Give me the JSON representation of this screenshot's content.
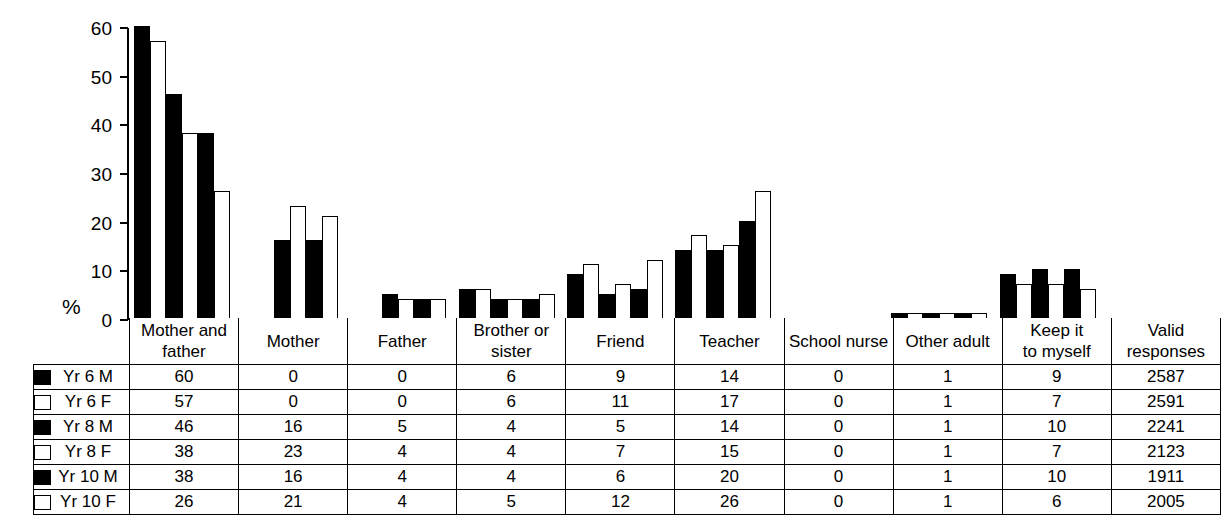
{
  "chart_data": {
    "type": "bar",
    "title": "",
    "xlabel": "",
    "ylabel": "%",
    "ylim": [
      0,
      60
    ],
    "yticks": [
      0,
      10,
      20,
      30,
      40,
      50,
      60
    ],
    "grid": false,
    "legend_position": "table-left",
    "categories": [
      "Mother and father",
      "Mother",
      "Father",
      "Brother or sister",
      "Friend",
      "Teacher",
      "School nurse",
      "Other adult",
      "Keep it to myself"
    ],
    "series": [
      {
        "name": "Yr 6 M",
        "style": "solid",
        "values": [
          60,
          0,
          0,
          6,
          9,
          14,
          0,
          1,
          9
        ]
      },
      {
        "name": "Yr 6 F",
        "style": "hollow",
        "values": [
          57,
          0,
          0,
          6,
          11,
          17,
          0,
          1,
          7
        ]
      },
      {
        "name": "Yr 8 M",
        "style": "solid",
        "values": [
          46,
          16,
          5,
          4,
          5,
          14,
          0,
          1,
          10
        ]
      },
      {
        "name": "Yr 8 F",
        "style": "hollow",
        "values": [
          38,
          23,
          4,
          4,
          7,
          15,
          0,
          1,
          7
        ]
      },
      {
        "name": "Yr 10 M",
        "style": "solid",
        "values": [
          38,
          16,
          4,
          4,
          6,
          20,
          0,
          1,
          10
        ]
      },
      {
        "name": "Yr 10 F",
        "style": "hollow",
        "values": [
          26,
          21,
          4,
          5,
          12,
          26,
          0,
          1,
          6
        ]
      }
    ],
    "extra_column": {
      "header": "Valid responses",
      "values": [
        2587,
        2591,
        2241,
        2123,
        1911,
        2005
      ]
    }
  },
  "axis": {
    "y_label": "%",
    "ticks": [
      "60",
      "50",
      "40",
      "30",
      "20",
      "10",
      "0"
    ]
  },
  "table": {
    "headers": [
      "Mother and father",
      "Mother",
      "Father",
      "Brother or sister",
      "Friend",
      "Teacher",
      "School nurse",
      "Other adult",
      "Keep it to myself",
      "Valid responses"
    ],
    "header_lines": [
      [
        "Mother and",
        "father"
      ],
      [
        "Mother",
        ""
      ],
      [
        "Father",
        ""
      ],
      [
        "Brother or",
        "sister"
      ],
      [
        "Friend",
        ""
      ],
      [
        "Teacher",
        ""
      ],
      [
        "School nurse",
        ""
      ],
      [
        "Other adult",
        ""
      ],
      [
        "Keep it",
        "to myself"
      ],
      [
        "Valid",
        "responses"
      ]
    ],
    "rows": [
      {
        "label": "Yr 6 M",
        "swatch": "solid",
        "cells": [
          "60",
          "0",
          "0",
          "6",
          "9",
          "14",
          "0",
          "1",
          "9",
          "2587"
        ]
      },
      {
        "label": "Yr 6 F",
        "swatch": "hollow",
        "cells": [
          "57",
          "0",
          "0",
          "6",
          "11",
          "17",
          "0",
          "1",
          "7",
          "2591"
        ]
      },
      {
        "label": "Yr 8 M",
        "swatch": "solid",
        "cells": [
          "46",
          "16",
          "5",
          "4",
          "5",
          "14",
          "0",
          "1",
          "10",
          "2241"
        ]
      },
      {
        "label": "Yr 8 F",
        "swatch": "hollow",
        "cells": [
          "38",
          "23",
          "4",
          "4",
          "7",
          "15",
          "0",
          "1",
          "7",
          "2123"
        ]
      },
      {
        "label": "Yr 10 M",
        "swatch": "solid",
        "cells": [
          "38",
          "16",
          "4",
          "4",
          "6",
          "20",
          "0",
          "1",
          "10",
          "1911"
        ]
      },
      {
        "label": "Yr 10 F",
        "swatch": "hollow",
        "cells": [
          "26",
          "21",
          "4",
          "5",
          "12",
          "26",
          "0",
          "1",
          "6",
          "2005"
        ]
      }
    ]
  },
  "colors": {
    "solid": "#000000",
    "hollow": "#ffffff",
    "outline": "#000000",
    "background": "#ffffff"
  }
}
